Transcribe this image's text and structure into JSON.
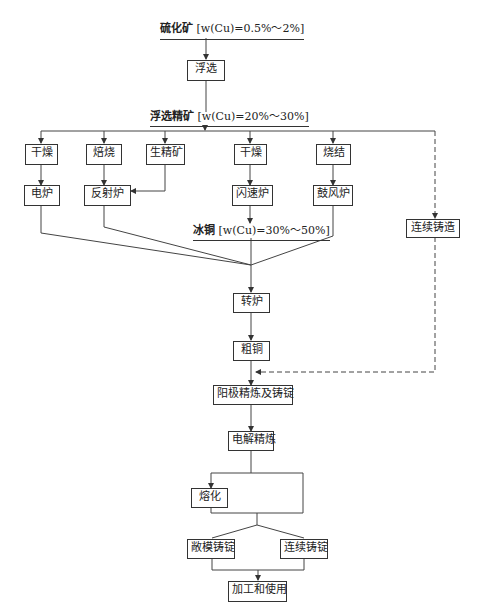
{
  "diagram": {
    "source": {
      "name": "硫化矿",
      "grade": "[w(Cu)=0.5%～2%]"
    },
    "flotation": "浮选",
    "concentrate": {
      "name": "浮选精矿",
      "grade": "[w(Cu)=20%～30%]"
    },
    "pretreat": [
      "干燥",
      "焙烧",
      "生精矿",
      "干燥",
      "烧结"
    ],
    "furnaces": [
      "电炉",
      "反射炉",
      "闪速炉",
      "鼓风炉"
    ],
    "continuous_casting": "连续铸造",
    "matte": {
      "name": "冰铜",
      "grade": "[w(Cu)=30%～50%]"
    },
    "converter": "转炉",
    "blister": "粗铜",
    "anode": "阳极精炼及铸锭",
    "electrolysis": "电解精炼",
    "melting": "熔化",
    "open_mold": "敞模铸锭",
    "cont_ingot": "连续铸锭",
    "use": "加工和使用"
  }
}
